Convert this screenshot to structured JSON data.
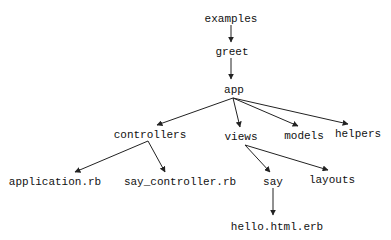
{
  "diagram": {
    "type": "directory-tree",
    "nodes": [
      {
        "id": "examples",
        "label": "examples",
        "x": 231,
        "y": 18
      },
      {
        "id": "greet",
        "label": "greet",
        "x": 232,
        "y": 51
      },
      {
        "id": "app",
        "label": "app",
        "x": 234,
        "y": 89
      },
      {
        "id": "controllers",
        "label": "controllers",
        "x": 150,
        "y": 134
      },
      {
        "id": "views",
        "label": "views",
        "x": 241,
        "y": 136
      },
      {
        "id": "models",
        "label": "models",
        "x": 304,
        "y": 135
      },
      {
        "id": "helpers",
        "label": "helpers",
        "x": 358,
        "y": 133
      },
      {
        "id": "application_rb",
        "label": "application.rb",
        "x": 55,
        "y": 181
      },
      {
        "id": "say_controller_rb",
        "label": "say_controller.rb",
        "x": 180,
        "y": 181
      },
      {
        "id": "say",
        "label": "say",
        "x": 273,
        "y": 181
      },
      {
        "id": "layouts",
        "label": "layouts",
        "x": 332,
        "y": 179
      },
      {
        "id": "hello_html_erb",
        "label": "hello.html.erb",
        "x": 277,
        "y": 226
      }
    ],
    "edges": [
      {
        "from": "examples",
        "to": "greet",
        "x1": 231,
        "y1": 25,
        "x2": 231,
        "y2": 42
      },
      {
        "from": "greet",
        "to": "app",
        "x1": 231,
        "y1": 58,
        "x2": 231,
        "y2": 79
      },
      {
        "from": "app",
        "to": "controllers",
        "x1": 233,
        "y1": 98,
        "x2": 157,
        "y2": 125
      },
      {
        "from": "app",
        "to": "views",
        "x1": 233,
        "y1": 98,
        "x2": 240,
        "y2": 127
      },
      {
        "from": "app",
        "to": "models",
        "x1": 233,
        "y1": 98,
        "x2": 298,
        "y2": 126
      },
      {
        "from": "app",
        "to": "helpers",
        "x1": 233,
        "y1": 98,
        "x2": 348,
        "y2": 124
      },
      {
        "from": "controllers",
        "to": "application_rb",
        "x1": 148,
        "y1": 141,
        "x2": 75,
        "y2": 172
      },
      {
        "from": "controllers",
        "to": "say_controller_rb",
        "x1": 148,
        "y1": 141,
        "x2": 165,
        "y2": 172
      },
      {
        "from": "views",
        "to": "say",
        "x1": 245,
        "y1": 145,
        "x2": 270,
        "y2": 172
      },
      {
        "from": "views",
        "to": "layouts",
        "x1": 245,
        "y1": 145,
        "x2": 328,
        "y2": 170
      },
      {
        "from": "say",
        "to": "hello_html_erb",
        "x1": 273,
        "y1": 188,
        "x2": 273,
        "y2": 215
      }
    ]
  },
  "colors": {
    "background": "#ffffff",
    "text": "#111111",
    "edge": "#222222"
  }
}
